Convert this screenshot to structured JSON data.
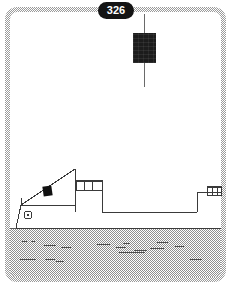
{
  "figure": {
    "panel_number": "326",
    "panel_shape": "rounded-rectangle-dithered-frame",
    "background_color": "#ffffff",
    "frame_color": "#9a9a9a",
    "ink_color": "#3a3a3a",
    "water_color": "#8f8f8f",
    "solid_black": "#141414"
  },
  "badge": {
    "label": "326"
  },
  "objects": {
    "instrument": {
      "name": "suspended-instrument",
      "fill": "#1c1c1c",
      "x": 133,
      "y": 33,
      "width": 23,
      "height": 30
    },
    "cable": {
      "name": "suspension-cable",
      "x": 144,
      "y_top": 14,
      "y_bottom": 87,
      "color": "#6a6a6a"
    },
    "ramp_block": {
      "name": "ramp-cargo-block",
      "fill": "#111111",
      "x": 43,
      "y": 186,
      "width": 9,
      "height": 10
    },
    "porthole": {
      "name": "bow-porthole",
      "cx": 27,
      "cy": 215,
      "r": 4
    },
    "railing_fore": {
      "name": "foredeck-railing",
      "x": 76,
      "y": 179,
      "width": 26,
      "height": 11,
      "posts": 4
    },
    "railing_aft": {
      "name": "aft-railing",
      "x": 206,
      "y": 186,
      "width": 15,
      "height": 10,
      "posts": 3
    }
  },
  "water": {
    "name": "water-surface",
    "top": 228,
    "left": 10,
    "width": 211,
    "height": 49,
    "wave_marks": [
      {
        "x": 22,
        "y": 241,
        "w": 5
      },
      {
        "x": 31,
        "y": 241,
        "w": 4
      },
      {
        "x": 44,
        "y": 245,
        "w": 12
      },
      {
        "x": 61,
        "y": 247,
        "w": 10
      },
      {
        "x": 97,
        "y": 244,
        "w": 13
      },
      {
        "x": 116,
        "y": 247,
        "w": 10
      },
      {
        "x": 123,
        "y": 243,
        "w": 7
      },
      {
        "x": 150,
        "y": 248,
        "w": 14
      },
      {
        "x": 157,
        "y": 242,
        "w": 11
      },
      {
        "x": 175,
        "y": 246,
        "w": 9
      },
      {
        "x": 119,
        "y": 252,
        "w": 26
      },
      {
        "x": 134,
        "y": 250,
        "w": 13
      },
      {
        "x": 20,
        "y": 259,
        "w": 16
      },
      {
        "x": 45,
        "y": 259,
        "w": 10
      },
      {
        "x": 56,
        "y": 261,
        "w": 8
      },
      {
        "x": 190,
        "y": 259,
        "w": 12
      }
    ]
  },
  "vessel": {
    "name": "vessel-profile",
    "outline": "M 14,220 L 18,206 L 75,206 L 75,169 L 89,190 L 89,196 L 102,196 L 102,211 L 197,211 L 197,191 L 221,191",
    "description": "ship side profile with inclined ramp, raised foredeck, well deck and aft deck"
  }
}
